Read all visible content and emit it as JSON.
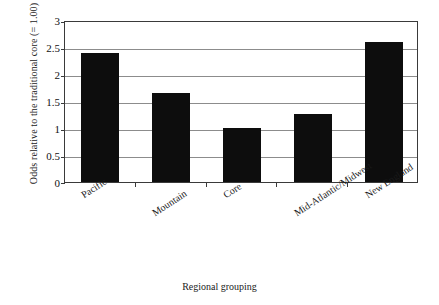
{
  "chart_data": {
    "type": "bar",
    "title": "",
    "xlabel": "Regional grouping",
    "ylabel": "Odds relative to the traditional core (= 1.00)",
    "categories": [
      "Pacific",
      "Mountain",
      "Core",
      "Mid-Atlantic/Midwest",
      "New England"
    ],
    "values": [
      2.38,
      1.65,
      1.0,
      1.26,
      2.6
    ],
    "ylim": [
      0,
      3
    ],
    "ytick_labels": [
      "3",
      "2.5",
      "2",
      "1.5",
      "1",
      "0.5",
      "0"
    ],
    "ytick_values": [
      3,
      2.5,
      2,
      1.5,
      1,
      0.5,
      0
    ],
    "grid": "horizontal",
    "legend": "none",
    "bar_color": "#0d0d0d",
    "gridline_color": "#8c8c8c",
    "axis_color": "#3a3a3a",
    "background_color": "#ffffff"
  }
}
